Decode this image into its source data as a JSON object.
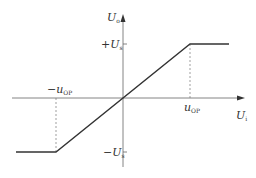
{
  "colors": {
    "axis": "#666666",
    "curve": "#333333",
    "dashed": "#777777",
    "text": "#333333"
  },
  "axes": {
    "x_label": {
      "main": "U",
      "sub": "i"
    },
    "y_label": {
      "main": "U",
      "sub": "o"
    }
  },
  "labels": {
    "pos_sat": {
      "prefix": "+U",
      "sub": "s"
    },
    "neg_sat": {
      "prefix": "−U",
      "sub": "s"
    },
    "pos_uop": {
      "prefix": "u",
      "sub": "OP"
    },
    "neg_uop": {
      "prefix": "−u",
      "sub": "OP"
    }
  },
  "geometry": {
    "origin": [
      123,
      98
    ],
    "x_axis": [
      12,
      245
    ],
    "y_axis": [
      167,
      15
    ],
    "curve_points": [
      [
        16,
        152
      ],
      [
        56,
        152
      ],
      [
        190,
        44
      ],
      [
        229,
        44
      ]
    ],
    "dashed_pos": [
      [
        190,
        44
      ],
      [
        190,
        98
      ]
    ],
    "dashed_neg": [
      [
        56,
        98
      ],
      [
        56,
        152
      ]
    ]
  }
}
